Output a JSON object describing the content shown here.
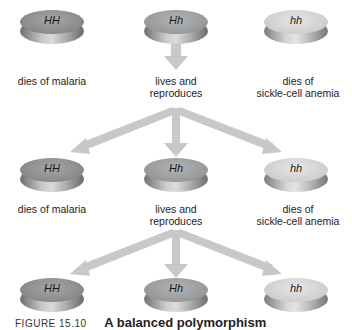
{
  "figure": {
    "caption_label": "FIGURE 15.10",
    "caption_title": "A balanced polymorphism"
  },
  "rows": [
    {
      "discs": [
        {
          "genotype": "HH",
          "shade": "dark",
          "outcome_line1": "dies of malaria",
          "outcome_line2": ""
        },
        {
          "genotype": "Hh",
          "shade": "mid",
          "outcome_line1": "lives and",
          "outcome_line2": "reproduces"
        },
        {
          "genotype": "hh",
          "shade": "light",
          "outcome_line1": "dies of",
          "outcome_line2": "sickle-cell anemia"
        }
      ]
    },
    {
      "discs": [
        {
          "genotype": "HH",
          "shade": "dark",
          "outcome_line1": "dies of malaria",
          "outcome_line2": ""
        },
        {
          "genotype": "Hh",
          "shade": "mid",
          "outcome_line1": "lives and",
          "outcome_line2": "reproduces"
        },
        {
          "genotype": "hh",
          "shade": "light",
          "outcome_line1": "dies of",
          "outcome_line2": "sickle-cell anemia"
        }
      ]
    },
    {
      "discs": [
        {
          "genotype": "HH",
          "shade": "dark"
        },
        {
          "genotype": "Hh",
          "shade": "mid"
        },
        {
          "genotype": "hh",
          "shade": "light"
        }
      ]
    }
  ],
  "colors": {
    "arrow": "#c8c8c8",
    "text": "#222222",
    "background": "#ffffff"
  }
}
